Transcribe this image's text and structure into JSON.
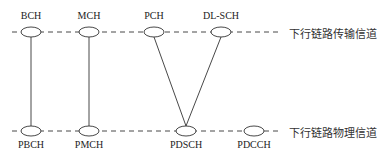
{
  "diagram": {
    "transport_layer": {
      "caption": "下行链路传输信道",
      "channels": [
        "BCH",
        "MCH",
        "PCH",
        "DL-SCH"
      ]
    },
    "physical_layer": {
      "caption": "下行链路物理信道",
      "channels": [
        "PBCH",
        "PMCH",
        "PDSCH",
        "PDCCH"
      ]
    },
    "mappings": [
      {
        "from": "BCH",
        "to": "PBCH"
      },
      {
        "from": "MCH",
        "to": "PMCH"
      },
      {
        "from": "PCH",
        "to": "PDSCH"
      },
      {
        "from": "DL-SCH",
        "to": "PDSCH"
      }
    ]
  }
}
